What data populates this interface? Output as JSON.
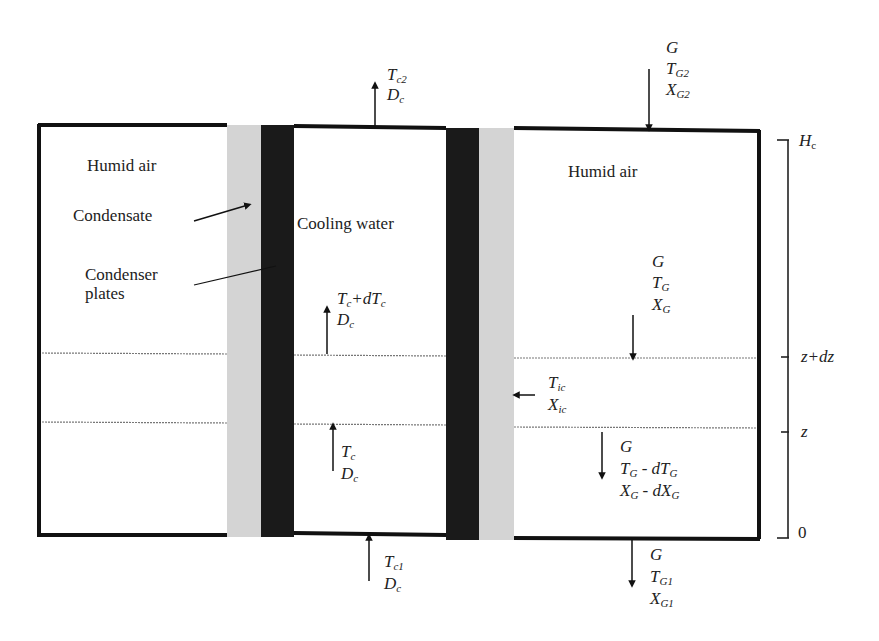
{
  "diagram": {
    "type": "counter-flow plate condenser control volume",
    "regions": {
      "left_air": "Humid air",
      "right_air": "Humid air",
      "condensate": "Condensate",
      "plates": "Condenser plates",
      "plates_line2": "plates",
      "plates_line1": "Condenser",
      "cooling_water": "Cooling water"
    },
    "colors": {
      "outline": "#111111",
      "plate": "#1a1a1a",
      "condensate": "#d4d4d4",
      "dotted_line": "#777777",
      "background": "#ffffff"
    },
    "streams": {
      "water_top_out": {
        "T_base": "T",
        "T_sub": "c2",
        "D_base": "D",
        "D_sub": "c"
      },
      "water_bottom_in": {
        "T_base": "T",
        "T_sub": "c1",
        "D_base": "D",
        "D_sub": "c"
      },
      "water_element_top": {
        "T_text": "T",
        "T_sub": "c",
        "plus": "+d",
        "T2": "T",
        "T2_sub": "c",
        "D_base": "D",
        "D_sub": "c"
      },
      "water_element_bottom": {
        "T_base": "T",
        "T_sub": "c",
        "D_base": "D",
        "D_sub": "c"
      },
      "air_top_in": {
        "G": "G",
        "T_base": "T",
        "T_sub": "G2",
        "X_base": "X",
        "X_sub": "G2"
      },
      "air_element_top": {
        "G": "G",
        "T_base": "T",
        "T_sub": "G",
        "X_base": "X",
        "X_sub": "G"
      },
      "interface": {
        "T_base": "T",
        "T_sub": "ic",
        "X_base": "X",
        "X_sub": "ic"
      },
      "air_element_bottom": {
        "G": "G",
        "T_base": "T",
        "T_sub": "G",
        "T_minus": " - dT",
        "T_minus_sub": "G",
        "X_base": "X",
        "X_sub": "G",
        "X_minus": " - dX",
        "X_minus_sub": "G"
      },
      "air_bottom_out": {
        "G": "G",
        "T_base": "T",
        "T_sub": "G1",
        "X_base": "X",
        "X_sub": "G1"
      }
    },
    "height_axis": {
      "top_label": "H",
      "top_sub": "c",
      "upper_tick": "z+dz",
      "lower_tick": "z",
      "bottom_label": "0"
    }
  }
}
